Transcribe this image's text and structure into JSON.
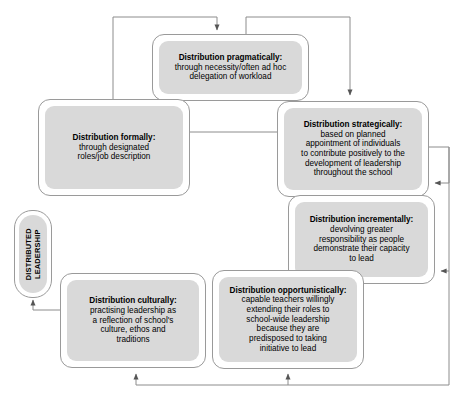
{
  "diagram": {
    "type": "cycle-flow-diagram",
    "colors": {
      "page_background": "#ffffff",
      "node_border": "#9a9a9a",
      "node_fill": "#ffffff",
      "inner_panel_fill": "#d9d9d9",
      "connector": "#8c8c8c",
      "text": "#000000"
    },
    "center_label": {
      "line1": "DISTRIBUTED",
      "line2": "LEADERSHIP"
    },
    "nodes": [
      {
        "id": "pragmatically",
        "heading": "Distribution pragmatically:",
        "body_lines": [
          "through necessity/often ad hoc",
          "delegation of workload"
        ]
      },
      {
        "id": "formally",
        "heading": "Distribution formally:",
        "body_lines": [
          "through designated",
          "roles/job description"
        ]
      },
      {
        "id": "strategically",
        "heading": "Distribution strategically:",
        "body_lines": [
          "based on planned",
          "appointment of individuals",
          "to contribute positively to the",
          "development of leadership",
          "throughout the school"
        ]
      },
      {
        "id": "incrementally",
        "heading": "Distribution incrementally:",
        "body_lines": [
          "devolving greater",
          "responsibility as people",
          "demonstrate their capacity",
          "to lead"
        ]
      },
      {
        "id": "opportunistically",
        "heading": "Distribution opportunistically:",
        "body_lines": [
          "capable teachers willingly",
          "extending their roles to",
          "school-wide leadership",
          "because they are",
          "predisposed to taking",
          "initiative to lead"
        ]
      },
      {
        "id": "culturally",
        "heading": "Distribution culturally:",
        "body_lines": [
          "practising leadership as",
          "a reflection of school's",
          "culture, ethos and",
          "traditions"
        ]
      }
    ],
    "connectors": [
      {
        "from": "formally-top-loop",
        "to": "pragmatically",
        "arrow": "down"
      },
      {
        "from": "pragmatically-top-loop",
        "to": "strategically",
        "arrow": "down"
      },
      {
        "from": "formally",
        "to": "strategically",
        "arrow": "none"
      },
      {
        "from": "right-bus",
        "to": "strategically",
        "arrow": "left"
      },
      {
        "from": "right-bus",
        "to": "incrementally",
        "arrow": "left"
      },
      {
        "from": "bottom-bus",
        "to": "opportunistically",
        "arrow": "up"
      },
      {
        "from": "bottom-bus",
        "to": "culturally",
        "arrow": "up"
      },
      {
        "from": "culturally",
        "to": "distributed-leadership",
        "arrow": "up"
      }
    ]
  }
}
